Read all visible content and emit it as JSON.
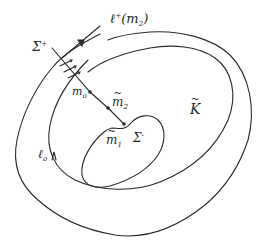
{
  "diagram": {
    "stroke_color": "#2a2a2a",
    "background": "#ffffff",
    "curves": [
      {
        "id": "outer",
        "label_ref": "l0"
      },
      {
        "id": "middle"
      },
      {
        "id": "inner"
      }
    ],
    "labels": {
      "sigma_plus": {
        "base": "Σ",
        "sup": "+"
      },
      "ell_plus": {
        "base": "ℓ",
        "sup": "+",
        "arg": "(m",
        "arg_sub": "2",
        "close": ")"
      },
      "m0": {
        "base": "m",
        "sub": "o"
      },
      "m2_tilde": {
        "base": "m",
        "sub": "2"
      },
      "m1_tilde": {
        "base": "m",
        "sub": "1"
      },
      "sigma_minus": {
        "base": "Σ",
        "sup": "-"
      },
      "k_tilde": {
        "base": "K"
      },
      "l0": {
        "base": "ℓ",
        "sub": "o"
      }
    },
    "points": [
      "m0",
      "m2_tilde",
      "m1_tilde"
    ]
  }
}
